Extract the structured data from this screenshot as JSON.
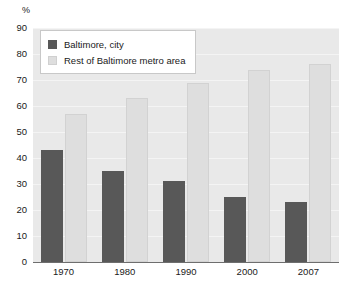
{
  "chart_data": {
    "type": "bar",
    "title": "",
    "subtitle": "",
    "xlabel": "",
    "ylabel": "%",
    "unit_label": "%",
    "categories": [
      "1970",
      "1980",
      "1990",
      "2000",
      "2007"
    ],
    "series": [
      {
        "name": "Baltimore, city",
        "color": "#585858",
        "values": [
          43,
          35,
          31,
          25,
          23
        ]
      },
      {
        "name": "Rest of Baltimore metro area",
        "color": "#dedede",
        "values": [
          57,
          63,
          69,
          74,
          76
        ]
      }
    ],
    "ylim": [
      0,
      90
    ],
    "ytick_step": 10,
    "yticks": [
      "90",
      "80",
      "70",
      "60",
      "50",
      "40",
      "30",
      "20",
      "10",
      "0"
    ],
    "grid": true,
    "grid_axis": "y",
    "legend_position": "top-left",
    "plot_background": "#e9e9e9",
    "axis_color": "#6e6e6e"
  }
}
